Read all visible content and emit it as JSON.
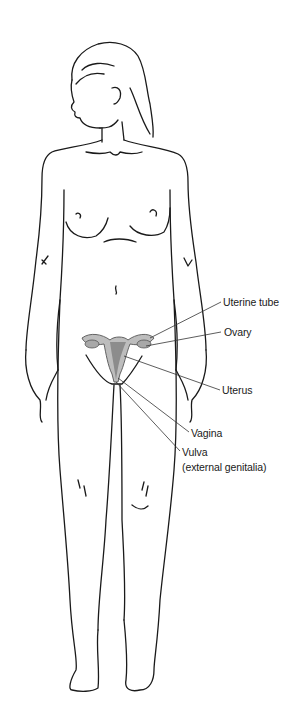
{
  "diagram": {
    "colors": {
      "line": "#1a1a1a",
      "organ_fill": "#b8b8b8",
      "organ_dark": "#8c8c8c",
      "leader": "#333333",
      "background": "#ffffff"
    },
    "labels": [
      {
        "id": "uterine-tube",
        "text": "Uterine tube",
        "x": 223,
        "y": 296
      },
      {
        "id": "ovary",
        "text": "Ovary",
        "x": 224,
        "y": 326
      },
      {
        "id": "uterus",
        "text": "Uterus",
        "x": 222,
        "y": 384
      },
      {
        "id": "vagina",
        "text": "Vagina",
        "x": 191,
        "y": 427
      },
      {
        "id": "vulva",
        "text": "Vulva",
        "x": 182,
        "y": 446
      },
      {
        "id": "vulva-sub",
        "text": "(external genitalia)",
        "x": 182,
        "y": 461
      }
    ]
  }
}
